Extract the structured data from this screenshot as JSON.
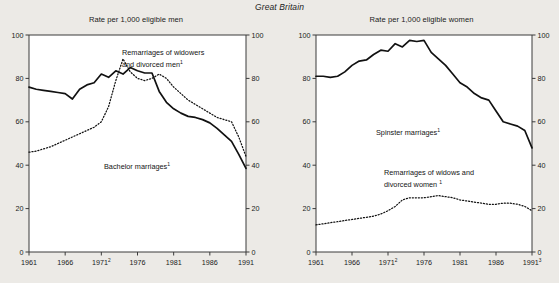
{
  "figure": {
    "title": "Great Britain",
    "footnote_markers": [
      "1",
      "2",
      "3"
    ]
  },
  "panels": [
    {
      "id": "men",
      "title": "Rate per 1,000 eligible men",
      "annotations": [
        {
          "name": "remarriages-men-label",
          "text": "Remarriages of widowers",
          "text2": "and divorced men",
          "sup": "1"
        },
        {
          "name": "bachelor-label",
          "text": "Bachelor marriages",
          "sup": "1"
        }
      ]
    },
    {
      "id": "women",
      "title": "Rate per 1,000 eligible women",
      "annotations": [
        {
          "name": "spinster-label",
          "text": "Spinster marriages",
          "sup": "1"
        },
        {
          "name": "remarriages-women-label",
          "text": "Remarriages of widows and",
          "text2": "divorced women",
          "sup": "1"
        }
      ]
    }
  ],
  "chart_data": [
    {
      "type": "line",
      "id": "men",
      "title": "Rate per 1,000 eligible men",
      "subtitle": "Great Britain",
      "xlabel": "",
      "ylabel": "Rate per 1,000 eligible men",
      "xlim": [
        1961,
        1991
      ],
      "ylim": [
        0,
        100
      ],
      "xticks": [
        "1961",
        "1966",
        "1971",
        "1976",
        "1981",
        "1986",
        "1991"
      ],
      "xtick_superscripts": [
        "",
        "",
        "2",
        "",
        "",
        "",
        ""
      ],
      "yticks": [
        0,
        20,
        40,
        60,
        80,
        100
      ],
      "grid": false,
      "legend": "inline-annotations",
      "dual_y_axis": true,
      "x": [
        1961,
        1962,
        1963,
        1964,
        1965,
        1966,
        1967,
        1968,
        1969,
        1970,
        1971,
        1972,
        1973,
        1974,
        1975,
        1976,
        1977,
        1978,
        1979,
        1980,
        1981,
        1982,
        1983,
        1984,
        1985,
        1986,
        1987,
        1988,
        1989,
        1990,
        1991
      ],
      "series": [
        {
          "name": "Bachelor marriages",
          "style": "solid",
          "values": [
            76,
            75,
            74.5,
            74,
            73.5,
            73,
            70.5,
            75,
            77,
            78,
            82,
            80.5,
            83.5,
            82,
            85,
            83.5,
            82.5,
            82.5,
            74,
            69,
            66,
            64,
            62.5,
            62,
            61,
            59.5,
            57,
            54,
            51,
            45,
            38.5
          ]
        },
        {
          "name": "Remarriages of widowers and divorced men",
          "style": "dotted",
          "values": [
            46,
            46.5,
            47.5,
            48.5,
            50,
            51.5,
            53,
            54.5,
            56,
            57.5,
            60,
            67,
            79,
            89,
            83,
            80,
            79,
            80,
            82,
            80,
            76,
            73,
            70,
            68,
            66,
            64,
            62,
            61,
            60,
            53,
            44
          ]
        }
      ]
    },
    {
      "type": "line",
      "id": "women",
      "title": "Rate per 1,000 eligible women",
      "subtitle": "Great Britain",
      "xlabel": "",
      "ylabel": "Rate per 1,000 eligible women",
      "xlim": [
        1961,
        1991
      ],
      "ylim": [
        0,
        100
      ],
      "xticks": [
        "1961",
        "1966",
        "1971",
        "1976",
        "1981",
        "1986",
        "1991"
      ],
      "xtick_superscripts": [
        "",
        "",
        "2",
        "",
        "",
        "",
        "3"
      ],
      "yticks": [
        0,
        20,
        40,
        60,
        80,
        100
      ],
      "grid": false,
      "legend": "inline-annotations",
      "dual_y_axis": true,
      "x": [
        1961,
        1962,
        1963,
        1964,
        1965,
        1966,
        1967,
        1968,
        1969,
        1970,
        1971,
        1972,
        1973,
        1974,
        1975,
        1976,
        1977,
        1978,
        1979,
        1980,
        1981,
        1982,
        1983,
        1984,
        1985,
        1986,
        1987,
        1988,
        1989,
        1990,
        1991
      ],
      "series": [
        {
          "name": "Spinster marriages",
          "style": "solid",
          "values": [
            81,
            81,
            80.5,
            81,
            83,
            86,
            88,
            88.5,
            91,
            93,
            92.5,
            96,
            94.5,
            97.5,
            97,
            97.5,
            92,
            89,
            86,
            82,
            78,
            76,
            73,
            71,
            70,
            65,
            60,
            59,
            58,
            56,
            48
          ]
        },
        {
          "name": "Remarriages of widows and divorced women",
          "style": "dotted",
          "values": [
            12.5,
            13,
            13.5,
            14,
            14.5,
            15,
            15.5,
            16,
            16.5,
            17.5,
            19,
            21,
            24,
            25,
            25,
            25,
            25.5,
            26,
            25.5,
            25,
            24,
            23.5,
            23,
            22.5,
            22,
            22,
            22.5,
            22.5,
            22,
            21,
            19
          ]
        }
      ]
    }
  ]
}
